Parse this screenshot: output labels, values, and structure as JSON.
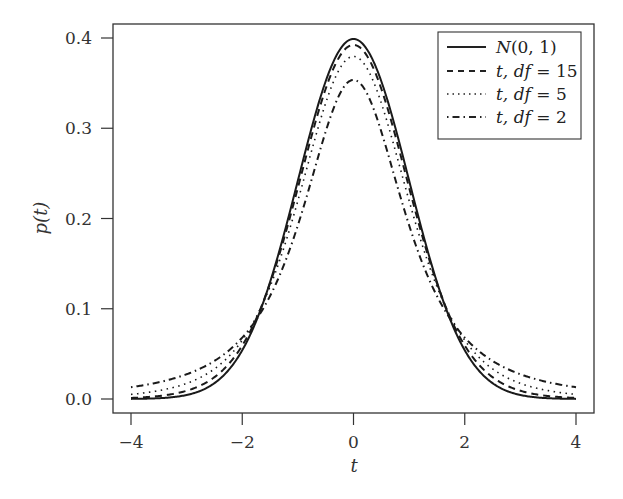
{
  "chart_data": {
    "type": "line",
    "title": "",
    "xlabel": "t",
    "ylabel": "p(t)",
    "xlim": [
      -4.3,
      4.3
    ],
    "ylim": [
      -0.005,
      0.415
    ],
    "xticks": [
      -4,
      -2,
      0,
      2,
      4
    ],
    "xtick_labels": [
      "−4",
      "−2",
      "0",
      "2",
      "4"
    ],
    "yticks": [
      0.0,
      0.1,
      0.2,
      0.3,
      0.4
    ],
    "ytick_labels": [
      "0.0",
      "0.1",
      "0.2",
      "0.3",
      "0.4"
    ],
    "grid": false,
    "legend_position": "upper right",
    "x": [
      -4,
      -3.5,
      -3,
      -2.5,
      -2,
      -1.5,
      -1,
      -0.5,
      0,
      0.5,
      1,
      1.5,
      2,
      2.5,
      3,
      3.5,
      4
    ],
    "series": [
      {
        "name": "N(0, 1)",
        "style": "solid",
        "values": [
          0.0001,
          0.0009,
          0.0044,
          0.0175,
          0.054,
          0.1295,
          0.242,
          0.3521,
          0.3989,
          0.3521,
          0.242,
          0.1295,
          0.054,
          0.0175,
          0.0044,
          0.0009,
          0.0001
        ]
      },
      {
        "name": "t, df = 15",
        "style": "dashed",
        "values": [
          0.0006,
          0.0022,
          0.0069,
          0.0211,
          0.0585,
          0.1322,
          0.2368,
          0.3438,
          0.3916,
          0.3438,
          0.2368,
          0.1322,
          0.0585,
          0.0211,
          0.0069,
          0.0022,
          0.0006
        ]
      },
      {
        "name": "t, df = 5",
        "style": "dotted",
        "values": [
          0.0051,
          0.0087,
          0.0173,
          0.0364,
          0.0651,
          0.1245,
          0.2197,
          0.3279,
          0.3796,
          0.3279,
          0.2197,
          0.1245,
          0.0651,
          0.0364,
          0.0173,
          0.0087,
          0.0051
        ]
      },
      {
        "name": "t, df = 2",
        "style": "dashdot",
        "values": [
          0.0131,
          0.0185,
          0.0274,
          0.0422,
          0.068,
          0.1134,
          0.1925,
          0.2963,
          0.3536,
          0.2963,
          0.1925,
          0.1134,
          0.068,
          0.0422,
          0.0274,
          0.0185,
          0.0131
        ]
      }
    ]
  },
  "legend": {
    "items": [
      {
        "label_main": "N",
        "label_rest": "(0, 1)"
      },
      {
        "label_main": "t, df",
        "label_rest": " = 15"
      },
      {
        "label_main": "t, df",
        "label_rest": " = 5"
      },
      {
        "label_main": "t, df",
        "label_rest": " = 2"
      }
    ]
  },
  "axes": {
    "x_label": "t",
    "y_label": "p(t)"
  }
}
